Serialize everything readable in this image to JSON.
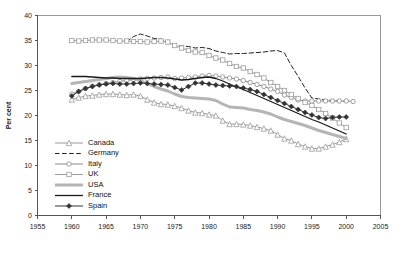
{
  "chart_data": {
    "type": "line",
    "title": "",
    "xlabel": "",
    "ylabel": "Per cent",
    "xlim": [
      1955,
      2005
    ],
    "ylim": [
      0,
      40
    ],
    "xticks": [
      1955,
      1960,
      1965,
      1970,
      1975,
      1980,
      1985,
      1990,
      1995,
      2000,
      2005
    ],
    "yticks": [
      0,
      5,
      10,
      15,
      20,
      25,
      30,
      35,
      40
    ],
    "grid": false,
    "legend_position": "lower-left-inside",
    "series": [
      {
        "name": "Canada",
        "color": "#9a9a9a",
        "marker": "open-triangle",
        "dash": "none",
        "x": [
          1960,
          1961,
          1962,
          1963,
          1964,
          1965,
          1966,
          1967,
          1968,
          1969,
          1970,
          1971,
          1972,
          1973,
          1974,
          1975,
          1976,
          1977,
          1978,
          1979,
          1980,
          1981,
          1982,
          1983,
          1984,
          1985,
          1986,
          1987,
          1988,
          1989,
          1990,
          1991,
          1992,
          1993,
          1994,
          1995,
          1996,
          1997,
          1998,
          1999,
          2000
        ],
        "values": [
          23.2,
          23.6,
          23.9,
          24.0,
          24.2,
          24.3,
          24.3,
          24.2,
          24.1,
          24.2,
          23.9,
          23.2,
          22.6,
          22.3,
          22.2,
          21.9,
          21.5,
          21.0,
          20.6,
          20.5,
          20.2,
          20.0,
          19.0,
          18.3,
          18.3,
          18.2,
          18.0,
          17.7,
          17.4,
          17.0,
          16.2,
          15.4,
          15.0,
          14.3,
          13.8,
          13.4,
          13.4,
          13.8,
          14.2,
          14.7,
          15.3
        ]
      },
      {
        "name": "Germany",
        "color": "#222222",
        "marker": "none",
        "dash": "dashed",
        "x": [
          1968,
          1969,
          1970,
          1971,
          1972,
          1973,
          1974,
          1975,
          1976,
          1977,
          1978,
          1979,
          1980,
          1981,
          1982,
          1983,
          1984,
          1985,
          1986,
          1987,
          1988,
          1989,
          1990,
          1991,
          1992,
          1993,
          1994,
          1995,
          1996,
          1997,
          1998,
          1999,
          2000
        ],
        "values": [
          34.8,
          35.8,
          36.3,
          35.9,
          35.4,
          35.3,
          34.6,
          34.0,
          33.9,
          33.8,
          33.5,
          33.6,
          33.4,
          32.9,
          32.6,
          32.3,
          32.4,
          32.4,
          32.5,
          32.6,
          32.7,
          32.9,
          33.0,
          32.5,
          30.0,
          27.8,
          25.5,
          23.5,
          23.3,
          23.1,
          23.0,
          22.9,
          22.8
        ]
      },
      {
        "name": "Italy",
        "color": "#8a8a8a",
        "marker": "open-circle",
        "dash": "none",
        "x": [
          1960,
          1961,
          1962,
          1963,
          1964,
          1965,
          1966,
          1967,
          1968,
          1969,
          1970,
          1971,
          1972,
          1973,
          1974,
          1975,
          1976,
          1977,
          1978,
          1979,
          1980,
          1981,
          1982,
          1983,
          1984,
          1985,
          1986,
          1987,
          1988,
          1989,
          1990,
          1991,
          1992,
          1993,
          1994,
          1995,
          1996,
          1997,
          1998,
          1999,
          2000,
          2001
        ],
        "values": [
          24.3,
          24.8,
          25.4,
          25.9,
          26.2,
          26.4,
          26.6,
          26.8,
          27.0,
          27.2,
          27.3,
          27.4,
          27.5,
          27.6,
          27.7,
          27.4,
          27.5,
          27.6,
          27.7,
          27.9,
          28.0,
          27.9,
          27.7,
          27.5,
          27.3,
          27.0,
          26.6,
          26.2,
          25.8,
          25.3,
          24.8,
          24.1,
          23.6,
          23.1,
          22.9,
          22.9,
          22.9,
          22.9,
          22.9,
          22.9,
          22.9,
          22.8
        ]
      },
      {
        "name": "UK",
        "color": "#9a9a9a",
        "marker": "open-square",
        "dash": "none",
        "x": [
          1960,
          1961,
          1962,
          1963,
          1964,
          1965,
          1966,
          1967,
          1968,
          1969,
          1970,
          1971,
          1972,
          1973,
          1974,
          1975,
          1976,
          1977,
          1978,
          1979,
          1980,
          1981,
          1982,
          1983,
          1984,
          1985,
          1986,
          1987,
          1988,
          1989,
          1990,
          1991,
          1992,
          1993,
          1994,
          1995,
          1996,
          1997,
          1998,
          1999,
          2000
        ],
        "values": [
          35.0,
          34.9,
          35.0,
          35.1,
          35.1,
          35.1,
          35.0,
          34.9,
          34.9,
          34.8,
          34.8,
          34.7,
          34.8,
          34.9,
          34.7,
          34.0,
          33.5,
          33.0,
          32.7,
          32.6,
          32.0,
          31.5,
          31.1,
          30.4,
          29.8,
          29.5,
          28.8,
          28.2,
          27.5,
          26.6,
          25.8,
          25.0,
          24.2,
          23.4,
          22.6,
          22.0,
          21.2,
          20.4,
          19.5,
          18.5,
          17.6
        ]
      },
      {
        "name": "USA",
        "color": "#b5b5b5",
        "marker": "none",
        "dash": "none",
        "width": 3,
        "x": [
          1960,
          1961,
          1962,
          1963,
          1964,
          1965,
          1966,
          1967,
          1968,
          1969,
          1970,
          1971,
          1972,
          1973,
          1974,
          1975,
          1976,
          1977,
          1978,
          1979,
          1980,
          1981,
          1982,
          1983,
          1984,
          1985,
          1986,
          1987,
          1988,
          1989,
          1990,
          1991,
          1992,
          1993,
          1994,
          1995,
          1996,
          1997,
          1998,
          1999,
          2000
        ],
        "values": [
          26.4,
          26.6,
          26.8,
          27.0,
          27.2,
          27.4,
          27.6,
          27.7,
          27.6,
          27.4,
          27.0,
          26.4,
          25.8,
          25.3,
          24.9,
          24.3,
          23.8,
          23.6,
          23.5,
          23.4,
          23.3,
          23.0,
          22.3,
          21.7,
          21.6,
          21.5,
          21.2,
          21.0,
          20.7,
          20.3,
          19.7,
          19.2,
          18.8,
          18.4,
          18.0,
          17.5,
          17.0,
          16.6,
          16.2,
          15.8,
          15.4
        ]
      },
      {
        "name": "France",
        "color": "#1a1a1a",
        "marker": "none",
        "dash": "none",
        "width": 1.3,
        "x": [
          1960,
          1961,
          1962,
          1963,
          1964,
          1965,
          1966,
          1967,
          1968,
          1969,
          1970,
          1971,
          1972,
          1973,
          1974,
          1975,
          1976,
          1977,
          1978,
          1979,
          1980,
          1981,
          1982,
          1983,
          1984,
          1985,
          1986,
          1987,
          1988,
          1989,
          1990,
          1991,
          1992,
          1993,
          1994,
          1995,
          1996,
          1997,
          1998,
          1999,
          2000
        ],
        "values": [
          27.8,
          27.8,
          27.8,
          27.7,
          27.6,
          27.5,
          27.5,
          27.4,
          27.4,
          27.4,
          27.4,
          27.5,
          27.6,
          27.6,
          27.5,
          27.3,
          27.1,
          27.2,
          27.4,
          27.6,
          27.7,
          27.4,
          26.9,
          26.3,
          25.7,
          25.2,
          24.6,
          24.0,
          23.4,
          22.8,
          22.2,
          21.6,
          21.0,
          20.4,
          19.8,
          19.2,
          18.7,
          18.1,
          17.5,
          16.9,
          16.3
        ]
      },
      {
        "name": "Spain",
        "color": "#333333",
        "marker": "filled-diamond",
        "dash": "none",
        "x": [
          1960,
          1961,
          1962,
          1963,
          1964,
          1965,
          1966,
          1967,
          1968,
          1969,
          1970,
          1971,
          1972,
          1973,
          1974,
          1975,
          1976,
          1977,
          1978,
          1979,
          1980,
          1981,
          1982,
          1983,
          1984,
          1985,
          1986,
          1987,
          1988,
          1989,
          1990,
          1991,
          1992,
          1993,
          1994,
          1995,
          1996,
          1997,
          1998,
          1999,
          2000
        ],
        "values": [
          23.9,
          24.8,
          25.4,
          25.8,
          26.1,
          26.3,
          26.4,
          26.3,
          26.3,
          26.4,
          26.5,
          26.4,
          26.3,
          26.2,
          26.1,
          25.6,
          25.1,
          25.8,
          26.5,
          26.5,
          26.3,
          26.1,
          26.0,
          25.9,
          25.8,
          25.5,
          25.2,
          24.8,
          24.2,
          23.6,
          23.0,
          22.4,
          21.8,
          21.2,
          20.6,
          20.1,
          19.6,
          19.4,
          19.6,
          19.7,
          19.7
        ]
      }
    ]
  },
  "axis": {
    "ylabel": "Per cent",
    "ytick_labels": [
      "0",
      "5",
      "10",
      "15",
      "20",
      "25",
      "30",
      "35",
      "40"
    ],
    "xtick_labels": [
      "1955",
      "1960",
      "1965",
      "1970",
      "1975",
      "1980",
      "1985",
      "1990",
      "1995",
      "2000",
      "2005"
    ]
  },
  "legend": {
    "items": [
      {
        "label": "Canada"
      },
      {
        "label": "Germany"
      },
      {
        "label": "Italy"
      },
      {
        "label": "UK"
      },
      {
        "label": "USA"
      },
      {
        "label": "France"
      },
      {
        "label": "Spain"
      }
    ]
  }
}
